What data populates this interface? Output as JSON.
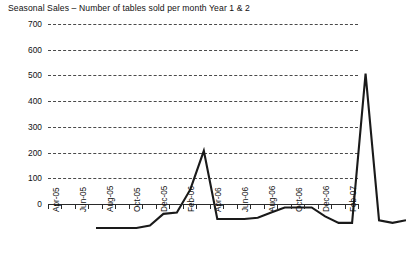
{
  "chart_data": {
    "type": "line",
    "title": "Seasonal Sales – Number of tables sold per month Year 1 & 2",
    "xlabel": "",
    "ylabel": "Units",
    "ylim": [
      0,
      700
    ],
    "ytick_values": [
      0,
      100,
      200,
      300,
      400,
      500,
      600,
      700
    ],
    "ytick_labels": [
      "0",
      "100",
      "200",
      "300",
      "400",
      "500",
      "600",
      "700"
    ],
    "grid": true,
    "grid_style": "dashed-horizontal",
    "legend": "none",
    "series_color": "#1a1a1a",
    "categories": [
      "Apr-05",
      "May-05",
      "Jun-05",
      "Jul-05",
      "Aug-05",
      "Sep-05",
      "Oct-05",
      "Nov-05",
      "Dec-05",
      "Jan-06",
      "Feb-06",
      "Mar-06",
      "Apr-06",
      "May-06",
      "Jun-06",
      "Jul-06",
      "Aug-06",
      "Sep-06",
      "Oct-06",
      "Nov-06",
      "Dec-06",
      "Jan-07",
      "Feb-07",
      "Mar-07"
    ],
    "xtick_labels": [
      "Apr-05",
      "Jun-05",
      "Aug-05",
      "Oct-05",
      "Dec-05",
      "Feb-06",
      "Apr-06",
      "Jun-06",
      "Aug-06",
      "Oct-06",
      "Dec-06",
      "Feb-07"
    ],
    "series": [
      {
        "name": "Units sold",
        "values": [
          0,
          0,
          0,
          0,
          10,
          55,
          60,
          150,
          300,
          35,
          35,
          35,
          40,
          60,
          80,
          80,
          80,
          45,
          20,
          20,
          600,
          30,
          20,
          30
        ]
      }
    ]
  }
}
